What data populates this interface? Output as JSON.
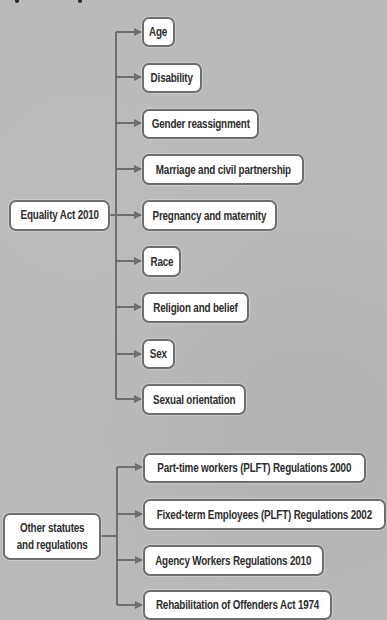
{
  "diagram": {
    "colors": {
      "background": "#b9b9b9",
      "box_fill": "#ffffff",
      "box_border": "#6e6e6e",
      "connector": "#6e6e6e",
      "text": "#2d2d2d"
    },
    "groups": [
      {
        "root": {
          "label": "Equality Act 2010"
        },
        "children": [
          {
            "label": "Age"
          },
          {
            "label": "Disability"
          },
          {
            "label": "Gender reassignment"
          },
          {
            "label": "Marriage and civil partnership"
          },
          {
            "label": "Pregnancy and maternity"
          },
          {
            "label": "Race"
          },
          {
            "label": "Religion and belief"
          },
          {
            "label": "Sex"
          },
          {
            "label": "Sexual orientation"
          }
        ]
      },
      {
        "root": {
          "label": "Other statutes\nand regulations"
        },
        "children": [
          {
            "label": "Part-time workers (PLFT) Regulations 2000"
          },
          {
            "label": "Fixed-term Employees (PLFT) Regulations 2002"
          },
          {
            "label": "Agency Workers Regulations 2010"
          },
          {
            "label": "Rehabilitation of Offenders Act 1974"
          }
        ]
      }
    ]
  }
}
